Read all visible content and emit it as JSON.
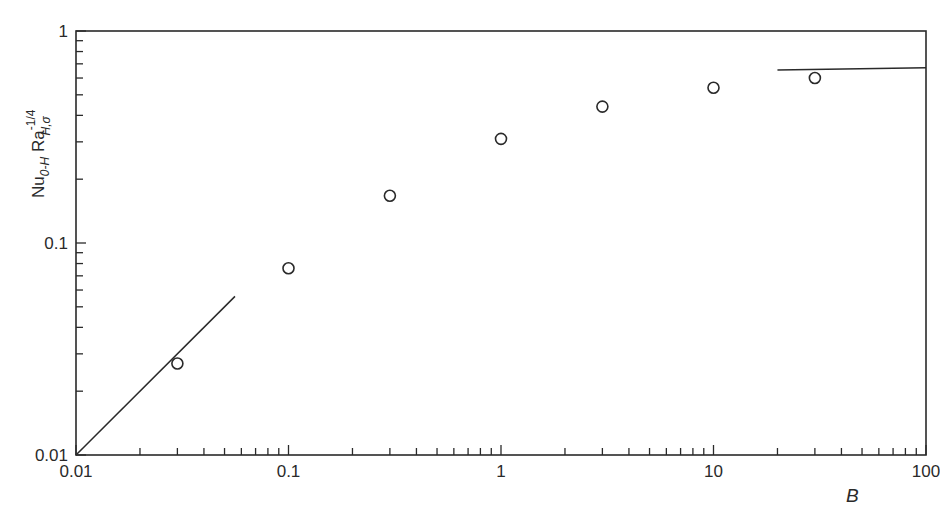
{
  "chart_data": {
    "type": "scatter",
    "title": "",
    "xlabel": "B",
    "ylabel": "Nu_{0-H} Ra_{H,σ}^{-1/4}",
    "ylabel_parts": {
      "base1": "Nu",
      "sub1": "0-H",
      "base2": "Ra",
      "sub2": "H,σ",
      "sup2": "-1/4"
    },
    "xscale": "log",
    "yscale": "log",
    "xlim": [
      0.01,
      100
    ],
    "ylim": [
      0.01,
      1
    ],
    "x_tick_labels": [
      "0.01",
      "0.1",
      "1",
      "10",
      "100"
    ],
    "x_ticks": [
      0.01,
      0.1,
      1,
      10,
      100
    ],
    "y_tick_labels": [
      "0.01",
      "0.1",
      "1"
    ],
    "y_ticks": [
      0.01,
      0.1,
      1
    ],
    "grid": false,
    "legend": null,
    "series": [
      {
        "name": "data",
        "kind": "markers",
        "marker": "open-circle",
        "x": [
          0.03,
          0.1,
          0.3,
          1,
          3,
          10,
          30
        ],
        "y": [
          0.027,
          0.076,
          0.167,
          0.31,
          0.44,
          0.54,
          0.6
        ]
      },
      {
        "name": "small-B asymptote",
        "kind": "line",
        "x": [
          0.01,
          0.056
        ],
        "y": [
          0.01,
          0.056
        ]
      },
      {
        "name": "large-B asymptote",
        "kind": "line",
        "x": [
          20,
          100
        ],
        "y": [
          0.655,
          0.67
        ]
      }
    ]
  }
}
